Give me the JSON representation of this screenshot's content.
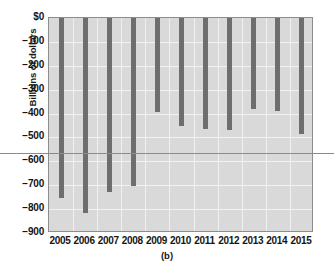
{
  "chart_data": {
    "type": "bar",
    "title": "",
    "caption": "(b)",
    "xlabel": "",
    "ylabel": "Billions of dollars",
    "categories": [
      "2005",
      "2006",
      "2007",
      "2008",
      "2009",
      "2010",
      "2011",
      "2012",
      "2013",
      "2014",
      "2015"
    ],
    "values": [
      -752,
      -815,
      -727,
      -702,
      -395,
      -450,
      -466,
      -470,
      -382,
      -390,
      -487
    ],
    "ylim": [
      -900,
      0
    ],
    "ytick_labels": [
      "$0",
      "−100",
      "−200",
      "−300",
      "−400",
      "−500",
      "−600",
      "−700",
      "−800",
      "−900"
    ],
    "ytick_values": [
      0,
      -100,
      -200,
      -300,
      -400,
      -500,
      -600,
      -700,
      -800,
      -900
    ],
    "grid": true,
    "legend": "none",
    "annotations": [
      {
        "name": "average-reference-line",
        "type": "hline",
        "value": -571
      }
    ],
    "series": [
      {
        "name": "Federal budget deficit",
        "values": [
          -752,
          -815,
          -727,
          -702,
          -395,
          -450,
          -466,
          -470,
          -382,
          -390,
          -487
        ]
      }
    ],
    "colors": {
      "bar": "#6e6e6e",
      "plot_background": "#d9d9d9",
      "gridline": "#f2f2f2",
      "average_line": "#8a8a8a",
      "frame": "#8d8d8d"
    }
  }
}
